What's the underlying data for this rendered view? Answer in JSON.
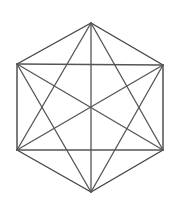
{
  "diagram": {
    "type": "complete-graph-hexagon",
    "vertices": [
      {
        "id": "top",
        "x": 91,
        "y": 23
      },
      {
        "id": "upper-right",
        "x": 163,
        "y": 65
      },
      {
        "id": "lower-right",
        "x": 163,
        "y": 150
      },
      {
        "id": "bottom",
        "x": 91,
        "y": 192
      },
      {
        "id": "lower-left",
        "x": 17,
        "y": 150
      },
      {
        "id": "upper-left",
        "x": 17,
        "y": 64
      }
    ],
    "edges": [
      {
        "from": 0,
        "to": 1,
        "kind": "outer"
      },
      {
        "from": 1,
        "to": 2,
        "kind": "outer"
      },
      {
        "from": 2,
        "to": 3,
        "kind": "outer"
      },
      {
        "from": 3,
        "to": 4,
        "kind": "outer"
      },
      {
        "from": 4,
        "to": 5,
        "kind": "outer"
      },
      {
        "from": 5,
        "to": 0,
        "kind": "outer"
      },
      {
        "from": 0,
        "to": 2,
        "kind": "diagonal"
      },
      {
        "from": 0,
        "to": 3,
        "kind": "diagonal"
      },
      {
        "from": 0,
        "to": 4,
        "kind": "diagonal"
      },
      {
        "from": 1,
        "to": 3,
        "kind": "diagonal"
      },
      {
        "from": 1,
        "to": 4,
        "kind": "diagonal"
      },
      {
        "from": 1,
        "to": 5,
        "kind": "diagonal"
      },
      {
        "from": 2,
        "to": 4,
        "kind": "diagonal"
      },
      {
        "from": 2,
        "to": 5,
        "kind": "diagonal"
      },
      {
        "from": 3,
        "to": 5,
        "kind": "diagonal"
      }
    ],
    "colors": {
      "stroke": "#555555",
      "background": "#ffffff"
    }
  }
}
